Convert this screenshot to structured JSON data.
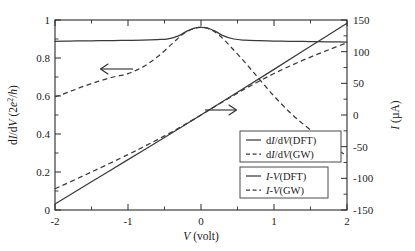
{
  "chart_data": {
    "type": "line",
    "title": "",
    "xlabel": "V (volt)",
    "ylabel_left": "dI/dV (2e2/h)",
    "ylabel_right": "I (µA)",
    "xlim": [
      -2,
      2
    ],
    "ylim_left": [
      0,
      1
    ],
    "ylim_right": [
      -150,
      150
    ],
    "grid": false,
    "legend_position": "lower-right",
    "xticks": [
      "-2",
      "-1",
      "0",
      "1",
      "2"
    ],
    "xtick_values": [
      -2,
      -1,
      0,
      1,
      2
    ],
    "yticks_left": [
      "0",
      "0.2",
      "0.4",
      "0.6",
      "0.8",
      "1"
    ],
    "ytick_values_left": [
      0,
      0.2,
      0.4,
      0.6,
      0.8,
      1
    ],
    "yticks_right": [
      "-150",
      "-100",
      "-50",
      "0",
      "50",
      "100",
      "150"
    ],
    "ytick_values_right": [
      -150,
      -100,
      -50,
      0,
      50,
      100,
      150
    ],
    "annotations": [
      {
        "name": "left-arrow",
        "glyph": "arrow-left",
        "meaning": "dI/dV curves use left axis",
        "x": -1.05,
        "y_left": 0.79
      },
      {
        "name": "right-arrow",
        "glyph": "arrow-right",
        "meaning": "I-V curves use right axis",
        "x": 0.42,
        "y_left": 0.475
      }
    ],
    "series": [
      {
        "name": "dI/dV(DFT)",
        "axis": "left",
        "style": "solid",
        "x": [
          -2,
          -1.8,
          -1.6,
          -1.4,
          -1.2,
          -1,
          -0.8,
          -0.6,
          -0.45,
          -0.3,
          -0.2,
          -0.1,
          0,
          0.1,
          0.2,
          0.3,
          0.45,
          0.6,
          0.8,
          1,
          1.2,
          1.4,
          1.6,
          1.8,
          2
        ],
        "values": [
          0.888,
          0.889,
          0.89,
          0.891,
          0.892,
          0.893,
          0.894,
          0.897,
          0.901,
          0.918,
          0.94,
          0.956,
          0.961,
          0.956,
          0.94,
          0.918,
          0.9,
          0.894,
          0.891,
          0.889,
          0.888,
          0.887,
          0.886,
          0.885,
          0.884
        ]
      },
      {
        "name": "dI/dV(GW)",
        "axis": "left",
        "style": "dashed",
        "x": [
          -2,
          -1.8,
          -1.6,
          -1.4,
          -1.2,
          -1,
          -0.8,
          -0.6,
          -0.4,
          -0.25,
          -0.12,
          0,
          0.12,
          0.25,
          0.4,
          0.6,
          0.8,
          1,
          1.2,
          1.4,
          1.6,
          1.8,
          2
        ],
        "values": [
          0.595,
          0.623,
          0.652,
          0.678,
          0.7,
          0.718,
          0.752,
          0.805,
          0.873,
          0.925,
          0.952,
          0.963,
          0.952,
          0.92,
          0.862,
          0.778,
          0.688,
          0.6,
          0.52,
          0.452,
          0.392,
          0.335,
          0.283
        ]
      },
      {
        "name": "I-V(DFT)",
        "axis": "right",
        "style": "solid",
        "x": [
          -2,
          -1.5,
          -1,
          -0.5,
          0,
          0.5,
          1,
          1.5,
          2
        ],
        "values": [
          -140.5,
          -105.5,
          -70.5,
          -35.5,
          0,
          35.8,
          72.0,
          108.5,
          145.0
        ]
      },
      {
        "name": "I-V(GW)",
        "axis": "right",
        "style": "dashed",
        "x": [
          -2,
          -1.5,
          -1,
          -0.75,
          -0.5,
          -0.25,
          0,
          0.25,
          0.5,
          0.75,
          1,
          1.25,
          1.5,
          1.75,
          2
        ],
        "values": [
          -116.5,
          -90.0,
          -62.5,
          -48.0,
          -33.0,
          -17.0,
          0,
          17.5,
          34.5,
          50.5,
          65.5,
          79.0,
          91.5,
          103.0,
          114.0
        ]
      }
    ]
  },
  "legend": {
    "box1": [
      {
        "label": "dI/dV(DFT)",
        "style": "solid"
      },
      {
        "label": "dI/dV(GW)",
        "style": "dashed"
      }
    ],
    "box2": [
      {
        "label": "I-V(DFT)",
        "style": "solid"
      },
      {
        "label": "I-V(GW)",
        "style": "dashed"
      }
    ]
  },
  "axes": {
    "x_label_italic": "V",
    "x_label_rest": " (volt)",
    "y_left_prefix": "d",
    "y_left_i": "I",
    "y_left_mid": "/d",
    "y_left_v": "V",
    "y_left_unit_open": " (2",
    "y_left_e": "e",
    "y_left_sup": "2",
    "y_left_slash": "/",
    "y_left_h": "h",
    "y_left_close": ")",
    "y_right_i": "I",
    "y_right_unit": " (µA)"
  },
  "colors": {
    "curve": "#3a3a3a",
    "frame": "#2b2b2b",
    "text": "#1a1a1a",
    "background": "#ffffff"
  }
}
